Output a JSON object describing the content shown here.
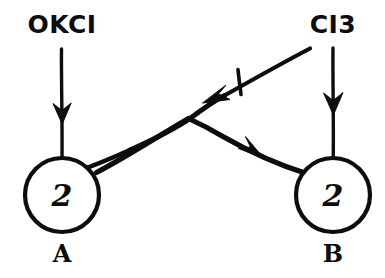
{
  "diagram": {
    "background_color": "#ffffff",
    "ink_color": "#0d0d0d",
    "nodes": [
      {
        "id": "A",
        "label": "A",
        "token_value": "2",
        "cx": 62,
        "cy": 195,
        "r": 37
      },
      {
        "id": "B",
        "label": "B",
        "token_value": "2",
        "cx": 333,
        "cy": 195,
        "r": 37
      }
    ],
    "input_labels": [
      {
        "id": "left-input",
        "text": "OKCI",
        "x": 62,
        "y": 33
      },
      {
        "id": "right-input",
        "text": "CI3",
        "x": 333,
        "y": 33
      }
    ],
    "edges": [
      {
        "id": "left-input-arrow",
        "kind": "vertical-arrow",
        "direction": "down",
        "from": [
          62,
          48
        ],
        "to": [
          62,
          158
        ],
        "target": "A"
      },
      {
        "id": "right-input-arrow",
        "kind": "vertical-arrow",
        "direction": "down",
        "from": [
          333,
          48
        ],
        "to": [
          333,
          158
        ],
        "target": "B"
      },
      {
        "id": "a-to-b-arrow",
        "kind": "diagonal-arrow",
        "direction": "down-right",
        "from": [
          95,
          173
        ],
        "to": [
          305,
          172
        ],
        "source": "A",
        "target": "B"
      },
      {
        "id": "crossing-inhibitor-arrow",
        "kind": "diagonal-arrow",
        "direction": "down-left",
        "from": [
          310,
          48
        ],
        "to": [
          85,
          50
        ],
        "marker": "tick",
        "note": "tick mark crossing the line near the arrowhead"
      }
    ]
  }
}
